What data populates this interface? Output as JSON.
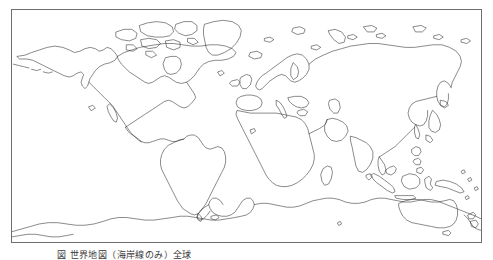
{
  "figure": {
    "kind": "world-coastline-outline-map",
    "projection": "equirectangular",
    "background_color": "#ffffff",
    "coastline_color": "#2b2b2b",
    "frame_color": "#6e6e6e",
    "frame": {
      "x": 11,
      "y": 9,
      "width": 471,
      "height": 234
    },
    "extent": {
      "lon_min": -180,
      "lon_max": 180,
      "lat_min": -90,
      "lat_max": 84
    },
    "caption": "図      世界地図（海岸線のみ）全球",
    "caption_clipped": true,
    "labels": [],
    "graticule": false,
    "legend": null
  }
}
